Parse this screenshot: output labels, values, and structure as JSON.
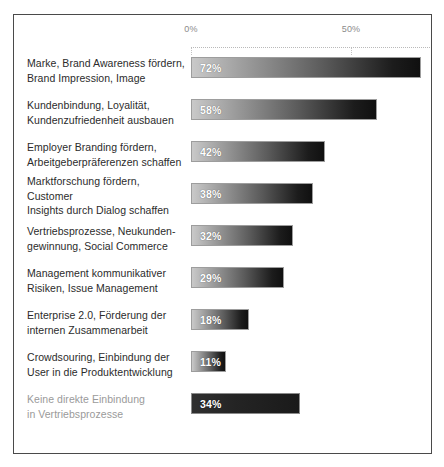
{
  "chart_data": {
    "type": "bar",
    "orientation": "horizontal",
    "title": "",
    "xlabel": "",
    "ylabel": "",
    "grid": true,
    "legend": "none",
    "xlim": [
      0,
      75
    ],
    "axis_ticks": [
      {
        "label": "0%",
        "value": 0
      },
      {
        "label": "50%",
        "value": 50
      }
    ],
    "categories": [
      "Marke, Brand Awareness fördern, Brand Impression, Image",
      "Kundenbindung, Loyalität, Kundenzufriedenheit ausbauen",
      "Employer Branding fördern, Arbeitgeberpräferenzen schaffen",
      "Marktforschung fördern, Customer Insights durch Dialog schaffen",
      "Vertriebsprozesse, Neukundengewinnung, Social Commerce",
      "Management kommunikativer Risiken, Issue Management",
      "Enterprise 2.0, Förderung der internen Zusammenarbeit",
      "Crowdsouring, Einbindung der User in die Produktentwicklung",
      "Keine direkte Einbindung in Vertriebsprozesse"
    ],
    "values": [
      72,
      58,
      42,
      38,
      32,
      29,
      18,
      11,
      34
    ],
    "value_labels": [
      "72%",
      "58%",
      "42%",
      "38%",
      "32%",
      "29%",
      "18%",
      "11%",
      "34%"
    ]
  },
  "rows": [
    {
      "label_line1": "Marke, Brand Awareness fördern,",
      "label_line2": "Brand Impression, Image",
      "value": 72,
      "value_label": "72%",
      "muted": false,
      "style": "gradient"
    },
    {
      "label_line1": "Kundenbindung, Loyalität,",
      "label_line2": "Kundenzufriedenheit ausbauen",
      "value": 58,
      "value_label": "58%",
      "muted": false,
      "style": "gradient"
    },
    {
      "label_line1": "Employer Branding fördern,",
      "label_line2": "Arbeitgeberpräferenzen schaffen",
      "value": 42,
      "value_label": "42%",
      "muted": false,
      "style": "gradient"
    },
    {
      "label_line1": "Marktforschung fördern, Customer",
      "label_line2": "Insights durch Dialog schaffen",
      "value": 38,
      "value_label": "38%",
      "muted": false,
      "style": "gradient"
    },
    {
      "label_line1": "Vertriebsprozesse, Neukunden-",
      "label_line2": "gewinnung, Social Commerce",
      "value": 32,
      "value_label": "32%",
      "muted": false,
      "style": "gradient"
    },
    {
      "label_line1": "Management kommunikativer",
      "label_line2": "Risiken, Issue Management",
      "value": 29,
      "value_label": "29%",
      "muted": false,
      "style": "gradient"
    },
    {
      "label_line1": "Enterprise 2.0, Förderung der",
      "label_line2": "internen Zusammenarbeit",
      "value": 18,
      "value_label": "18%",
      "muted": false,
      "style": "gradient"
    },
    {
      "label_line1": "Crowdsouring, Einbindung der",
      "label_line2": "User in die Produktentwicklung",
      "value": 11,
      "value_label": "11%",
      "muted": false,
      "style": "gradient"
    },
    {
      "label_line1": "Keine direkte Einbindung",
      "label_line2": "in Vertriebsprozesse",
      "value": 34,
      "value_label": "34%",
      "muted": true,
      "style": "flat"
    }
  ],
  "colors": {
    "frame_border": "#4a4a4a",
    "axis_text": "#8b8b8b",
    "gridline": "#b9b9b9",
    "label_text": "#2b2b2b",
    "label_muted": "#9a9a9a",
    "bar_light": "#c9c9c9",
    "bar_dark": "#101010",
    "bar_flat": "#242424",
    "value_text": "#ffffff",
    "background": "#ffffff"
  },
  "scale": {
    "origin_x_px": 0,
    "px_per_percent": 3.2,
    "track_width_px": 242
  }
}
